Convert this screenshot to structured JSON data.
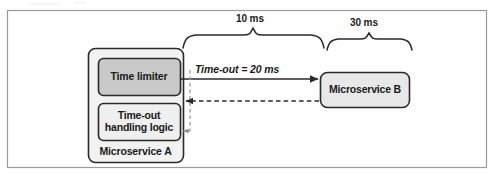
{
  "figure": {
    "kind": "sequence-timing-diagram",
    "frame": {
      "border_color": "#9a9a9a",
      "background": "#ffffff"
    },
    "colors": {
      "outer_box_fill": "#f2f2f2",
      "time_limiter_fill": "#c9c9c9",
      "timeout_logic_fill": "#efefef",
      "microservice_b_fill": "#e8e8e8",
      "stroke": "#2a2a2a",
      "dashed_gray": "#9b9b9b",
      "text": "#1a1a1a"
    },
    "nodes": {
      "microservice_a": {
        "label": "Microservice A",
        "children": {
          "time_limiter": {
            "label": "Time limiter"
          },
          "timeout_handling_logic": {
            "label": "Time-out\nhandling logic",
            "line1": "Time-out",
            "line2": "handling logic"
          }
        }
      },
      "microservice_b": {
        "label": "Microservice B"
      }
    },
    "edges": {
      "request": {
        "label": "Time-out = 20 ms",
        "style": "solid",
        "direction": "a-to-b"
      },
      "response": {
        "label": "",
        "style": "dashed",
        "direction": "b-to-a"
      },
      "timeout_trigger": {
        "label": "",
        "style": "dashed",
        "direction": "to-timeout-logic"
      }
    },
    "braces": [
      {
        "name": "network-latency-brace",
        "label": "10 ms"
      },
      {
        "name": "service-processing-brace",
        "label": "30 ms"
      }
    ]
  }
}
